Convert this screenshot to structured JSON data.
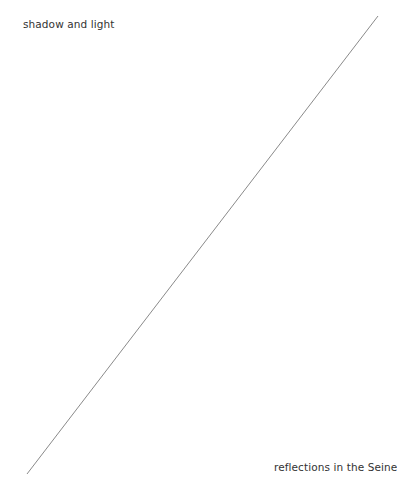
{
  "diagram": {
    "labels": {
      "top_left": "shadow and light",
      "bottom_right": "reflections in the Seine"
    },
    "line": {
      "x1": 378,
      "y1": 16,
      "x2": 27,
      "y2": 474,
      "color": "#8a8a8a",
      "width": 1
    },
    "background": "#ffffff",
    "text_color": "#333333"
  }
}
